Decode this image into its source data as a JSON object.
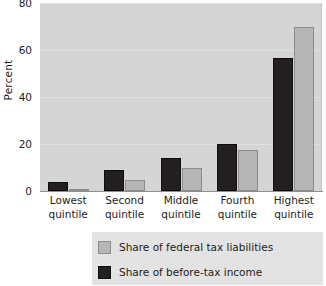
{
  "chart_data": {
    "type": "bar",
    "title": "",
    "subtitle": "",
    "xlabel": "",
    "ylabel": "Percent",
    "ylim": [
      0,
      80
    ],
    "yticks": [
      0,
      20,
      40,
      60,
      80
    ],
    "ytick_labels": [
      "0",
      "20",
      "40",
      "60",
      "80"
    ],
    "grid": true,
    "grid_axis": "y",
    "legend_position": "below-axes",
    "categories": [
      "Lowest quintile",
      "Second quintile",
      "Middle quintile",
      "Fourth quintile",
      "Highest quintile"
    ],
    "category_lines": [
      [
        "Lowest",
        "quintile"
      ],
      [
        "Second",
        "quintile"
      ],
      [
        "Middle",
        "quintile"
      ],
      [
        "Fourth",
        "quintile"
      ],
      [
        "Highest",
        "quintile"
      ]
    ],
    "series": [
      {
        "name": "Share of before-tax income",
        "color": "#231f20",
        "values": [
          4.0,
          9.0,
          14.0,
          20.0,
          56.5
        ]
      },
      {
        "name": "Share of federal tax liabilities",
        "color": "#b6b6b6",
        "values": [
          0.8,
          4.5,
          10.0,
          17.5,
          70.0
        ]
      }
    ],
    "legend_entries": [
      {
        "label": "Share of federal tax liabilities",
        "color": "#b6b6b6",
        "swatch": "swatch-tax"
      },
      {
        "label": "Share of before-tax income",
        "color": "#231f20",
        "swatch": "swatch-income"
      }
    ]
  },
  "axes": {
    "y_title": "Percent"
  },
  "colors": {
    "plot_background": "#d5d5d5",
    "page_background": "#ffffff",
    "legend_background": "#e3e3e3",
    "gridline": "#e0e0e0",
    "axis_line": "#8f8f8f",
    "series_income": "#231f20",
    "series_tax": "#b6b6b6"
  }
}
